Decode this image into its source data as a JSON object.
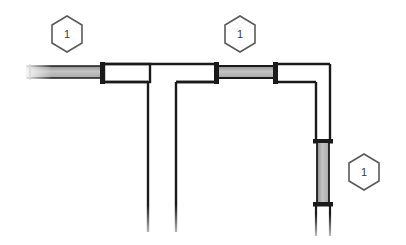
{
  "drawing": {
    "title": "Piping assembly orthographic view",
    "background_color": "#ffffff",
    "line_color": "#1a1a1a",
    "pipe_fill_color": "#ffffff",
    "gasket_fill_color": "#b8b8b8",
    "faded_color": "#9a9a9a",
    "balloon_stroke_color": "#5a5a5a",
    "balloon_text_color": "#3a3a3a"
  },
  "balloons": [
    {
      "id": "balloon-left",
      "label": "1",
      "shape": "hexagon",
      "cx": 67,
      "cy": 34,
      "r": 18
    },
    {
      "id": "balloon-center",
      "label": "1",
      "shape": "hexagon",
      "cx": 240,
      "cy": 34,
      "r": 18
    },
    {
      "id": "balloon-right",
      "label": "1",
      "shape": "hexagon",
      "cx": 364,
      "cy": 172,
      "r": 18
    }
  ],
  "components": {
    "header_pipe_label": "horizontal-header-pipe",
    "branch_pipe_label": "vertical-branch-pipe",
    "riser_pipe_label": "vertical-riser-pipe",
    "elbow_label": "ninety-degree-elbow",
    "tee_label": "tee-junction",
    "left_spool_label": "left-gasket-spool",
    "center_spool_label": "center-gasket-spool",
    "riser_spool_label": "riser-gasket-spool",
    "left_cut_end_label": "left-cut-end",
    "bottom_cut_end_label": "bottom-cut-end"
  }
}
